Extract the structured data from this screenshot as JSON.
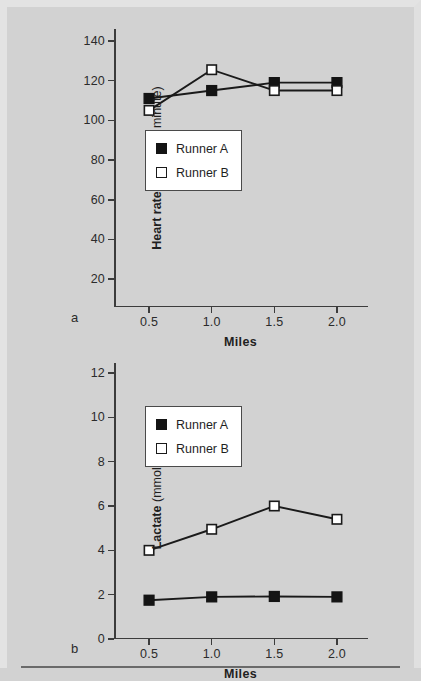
{
  "figure": {
    "background_color": "#d2d2d2",
    "marker_filled_color": "#141414",
    "marker_open_color": "#ffffff",
    "line_color": "#1a1a1a",
    "axis_color": "#3c3c3c"
  },
  "panels": [
    {
      "letter": "a",
      "chart_data": {
        "type": "line",
        "title": "",
        "xlabel": "Miles",
        "ylabel_strong": "Heart rate",
        "ylabel_light": "(beats per minute)",
        "x": [
          0.5,
          1.0,
          1.5,
          2.0
        ],
        "xtick_labels": [
          "0.5",
          "1.0",
          "1.5",
          "2.0"
        ],
        "xlim": [
          0.22,
          2.24
        ],
        "ytick_labels": [
          "140",
          "120",
          "100",
          "80",
          "60",
          "40",
          "20"
        ],
        "yticks": [
          140,
          120,
          100,
          80,
          60,
          40,
          20
        ],
        "ylim": [
          6,
          146
        ],
        "grid": false,
        "legend_position": "center-left-inside",
        "series": [
          {
            "name": "Runner A",
            "marker": "filled-square",
            "values": [
              111,
              115,
              119,
              119
            ]
          },
          {
            "name": "Runner B",
            "marker": "open-square",
            "values": [
              105,
              125.5,
              115,
              115
            ]
          }
        ]
      }
    },
    {
      "letter": "b",
      "chart_data": {
        "type": "line",
        "title": "",
        "xlabel": "Miles",
        "ylabel_strong": "Lactate",
        "ylabel_light": "(mmol/L)",
        "x": [
          0.5,
          1.0,
          1.5,
          2.0
        ],
        "xtick_labels": [
          "0.5",
          "1.0",
          "1.5",
          "2.0"
        ],
        "xlim": [
          0.22,
          2.24
        ],
        "ytick_labels": [
          "12",
          "10",
          "8",
          "6",
          "4",
          "2",
          "0"
        ],
        "yticks": [
          12,
          10,
          8,
          6,
          4,
          2,
          0
        ],
        "ylim": [
          0,
          12.45
        ],
        "grid": false,
        "legend_position": "upper-left-inside",
        "series": [
          {
            "name": "Runner A",
            "marker": "filled-square",
            "values": [
              1.75,
              1.9,
              1.92,
              1.9
            ]
          },
          {
            "name": "Runner B",
            "marker": "open-square",
            "values": [
              4.0,
              4.95,
              6.0,
              5.4
            ]
          }
        ]
      }
    }
  ]
}
